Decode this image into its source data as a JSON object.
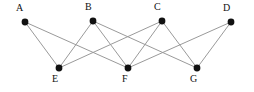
{
  "figure": {
    "width": 254,
    "height": 92,
    "background_color": "#ffffff",
    "edge_color": "#9a9a9a",
    "vertex_color": "#111111",
    "label_color": "#111111"
  },
  "graph": {
    "type": "undirected-bipartite-graph",
    "vertex_count": 7,
    "edge_count": 10,
    "top_row": [
      "A",
      "B",
      "C",
      "D"
    ],
    "bottom_row": [
      "E",
      "F",
      "G"
    ],
    "vertices": [
      {
        "id": "A",
        "label": "A",
        "x": 25,
        "y": 22,
        "r": 3.4,
        "label_x": 16,
        "label_y": 3,
        "row": "top"
      },
      {
        "id": "B",
        "label": "B",
        "x": 93,
        "y": 21,
        "r": 3.4,
        "label_x": 85,
        "label_y": 2,
        "row": "top"
      },
      {
        "id": "C",
        "label": "C",
        "x": 162,
        "y": 21,
        "r": 3.4,
        "label_x": 154,
        "label_y": 2,
        "row": "top"
      },
      {
        "id": "D",
        "label": "D",
        "x": 231,
        "y": 22,
        "r": 3.4,
        "label_x": 223,
        "label_y": 3,
        "row": "top"
      },
      {
        "id": "E",
        "label": "E",
        "x": 59,
        "y": 68,
        "r": 3.4,
        "label_x": 52,
        "label_y": 74,
        "row": "bottom"
      },
      {
        "id": "F",
        "label": "F",
        "x": 128,
        "y": 68,
        "r": 3.4,
        "label_x": 122,
        "label_y": 74,
        "row": "bottom"
      },
      {
        "id": "G",
        "label": "G",
        "x": 197,
        "y": 68,
        "r": 3.4,
        "label_x": 190,
        "label_y": 74,
        "row": "bottom"
      }
    ],
    "edges": [
      {
        "from": "A",
        "to": "E"
      },
      {
        "from": "A",
        "to": "F"
      },
      {
        "from": "B",
        "to": "E"
      },
      {
        "from": "B",
        "to": "F"
      },
      {
        "from": "B",
        "to": "G"
      },
      {
        "from": "C",
        "to": "E"
      },
      {
        "from": "C",
        "to": "F"
      },
      {
        "from": "C",
        "to": "G"
      },
      {
        "from": "D",
        "to": "F"
      },
      {
        "from": "D",
        "to": "G"
      }
    ]
  }
}
